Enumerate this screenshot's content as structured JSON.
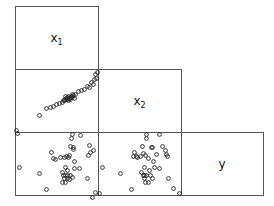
{
  "chart_data": {
    "type": "scatter",
    "title": "",
    "layout": "lower-triangle scatterplot matrix (pairs plot)",
    "variables": [
      "x1",
      "x2",
      "y"
    ],
    "diagonal_labels": [
      {
        "var": "x1",
        "text": "x",
        "sub": "1"
      },
      {
        "var": "x2",
        "text": "x",
        "sub": "2"
      },
      {
        "var": "y",
        "text": "y",
        "sub": ""
      }
    ],
    "grid": false,
    "axes_ticks": false,
    "panels": [
      {
        "row": 2,
        "col": 1,
        "x_var": "x1",
        "y_var": "x2",
        "note": "strong positive linear relationship",
        "points_px": [
          [
            1,
            61
          ],
          [
            24,
            46
          ],
          [
            31,
            39
          ],
          [
            35,
            38
          ],
          [
            38,
            37
          ],
          [
            41,
            35
          ],
          [
            44,
            34
          ],
          [
            47,
            33
          ],
          [
            49,
            31
          ],
          [
            50,
            30
          ],
          [
            51,
            29
          ],
          [
            52,
            28
          ],
          [
            53,
            27
          ],
          [
            54,
            29
          ],
          [
            55,
            28
          ],
          [
            56,
            27
          ],
          [
            57,
            28
          ],
          [
            58,
            26
          ],
          [
            50,
            27
          ],
          [
            52,
            30
          ],
          [
            53,
            31
          ],
          [
            48,
            31
          ],
          [
            55,
            30
          ],
          [
            60,
            25
          ],
          [
            63,
            22
          ],
          [
            66,
            21
          ],
          [
            69,
            20
          ],
          [
            72,
            17
          ],
          [
            76,
            13
          ],
          [
            78,
            15
          ],
          [
            79,
            10
          ],
          [
            81,
            9
          ],
          [
            80,
            5
          ],
          [
            82,
            3
          ],
          [
            74,
            18
          ],
          [
            57,
            25
          ],
          [
            59,
            29
          ]
        ]
      },
      {
        "row": 3,
        "col": 1,
        "x_var": "x1",
        "y_var": "y",
        "note": "weak / no clear relationship",
        "points_px": [
          [
            2,
            1
          ],
          [
            57,
            2
          ],
          [
            65,
            3
          ],
          [
            56,
            6
          ],
          [
            55,
            14
          ],
          [
            58,
            15
          ],
          [
            58,
            17
          ],
          [
            74,
            13
          ],
          [
            75,
            20
          ],
          [
            78,
            18
          ],
          [
            73,
            23
          ],
          [
            54,
            23
          ],
          [
            36,
            20
          ],
          [
            38,
            26
          ],
          [
            40,
            27
          ],
          [
            45,
            25
          ],
          [
            49,
            25
          ],
          [
            53,
            25
          ],
          [
            51,
            24
          ],
          [
            59,
            29
          ],
          [
            4,
            35
          ],
          [
            24,
            41
          ],
          [
            31,
            57
          ],
          [
            50,
            35
          ],
          [
            52,
            38
          ],
          [
            59,
            36
          ],
          [
            64,
            36
          ],
          [
            47,
            40
          ],
          [
            48,
            43
          ],
          [
            50,
            43
          ],
          [
            52,
            43
          ],
          [
            55,
            43
          ],
          [
            49,
            46
          ],
          [
            52,
            46
          ],
          [
            57,
            45
          ],
          [
            47,
            50
          ],
          [
            50,
            50
          ],
          [
            54,
            47
          ],
          [
            72,
            46
          ],
          [
            77,
            65
          ],
          [
            80,
            60
          ]
        ]
      },
      {
        "row": 3,
        "col": 2,
        "x_var": "x2",
        "y_var": "y",
        "note": "weak / no clear relationship",
        "points_px": [
          [
            1,
            61
          ],
          [
            48,
            2
          ],
          [
            61,
            2
          ],
          [
            48,
            6
          ],
          [
            44,
            14
          ],
          [
            53,
            15
          ],
          [
            54,
            15
          ],
          [
            64,
            14
          ],
          [
            67,
            18
          ],
          [
            68,
            22
          ],
          [
            69,
            24
          ],
          [
            45,
            21
          ],
          [
            47,
            23
          ],
          [
            58,
            22
          ],
          [
            50,
            26
          ],
          [
            36,
            20
          ],
          [
            35,
            24
          ],
          [
            38,
            24
          ],
          [
            39,
            25
          ],
          [
            42,
            24
          ],
          [
            55,
            29
          ],
          [
            4,
            35
          ],
          [
            22,
            41
          ],
          [
            33,
            57
          ],
          [
            46,
            35
          ],
          [
            51,
            38
          ],
          [
            56,
            35
          ],
          [
            61,
            36
          ],
          [
            43,
            40
          ],
          [
            45,
            43
          ],
          [
            46,
            43
          ],
          [
            48,
            43
          ],
          [
            52,
            43
          ],
          [
            46,
            46
          ],
          [
            47,
            50
          ],
          [
            50,
            50
          ],
          [
            54,
            46
          ],
          [
            70,
            46
          ],
          [
            75,
            56
          ],
          [
            81,
            61
          ]
        ]
      }
    ]
  },
  "geometry": {
    "cols_x": [
      15,
      98,
      181,
      263
    ],
    "rows_y": [
      6,
      69,
      132,
      195
    ]
  }
}
